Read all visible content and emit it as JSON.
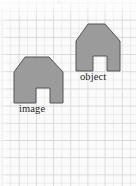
{
  "figure": {
    "kind": "geometry-transformation-figure",
    "background_color": "#fbfbfb",
    "grid": {
      "major_line_color": "#d8d8d8",
      "minor_line_color": "#ececec",
      "cell_size_px": 17.2,
      "visible": true
    },
    "shape_style": {
      "fill_color": "#9b9b9b",
      "stroke_color": "#555555",
      "stroke_width_px": 1
    },
    "top_cropped_text": "p",
    "labels": {
      "image": "image",
      "object": "object"
    },
    "shapes": [
      {
        "name": "image-polygon",
        "label": "image",
        "fill": "#9b9b9b",
        "stroke": "#555555",
        "points": "14,72 25,57 49,57 63,72 63,103 50,103 50,88 36,88 36,103 14,103",
        "notch": {
          "x": 36,
          "y": 88,
          "width": 14,
          "height": 15
        },
        "bbox": {
          "x": 14,
          "y": 57,
          "width": 49,
          "height": 46
        }
      },
      {
        "name": "object-polygon",
        "label": "object",
        "fill": "#9b9b9b",
        "stroke": "#555555",
        "points": "76,41 88,24 105,24 120,41 120,71 107,71 107,56 93,56 93,71 76,71",
        "notch": {
          "x": 93,
          "y": 56,
          "width": 14,
          "height": 15
        },
        "bbox": {
          "x": 76,
          "y": 24,
          "width": 44,
          "height": 47
        }
      }
    ]
  },
  "canvas": {
    "width": 136,
    "height": 186
  }
}
